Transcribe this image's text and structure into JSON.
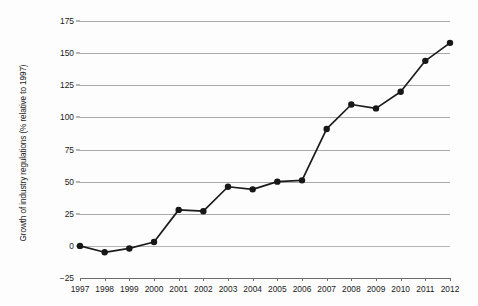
{
  "chart_data": {
    "type": "line",
    "title": "",
    "xlabel": "",
    "ylabel": "Growth of industry regulations (% relative to 1997)",
    "categories": [
      "1997",
      "1998",
      "1999",
      "2000",
      "2001",
      "2002",
      "2003",
      "2004",
      "2005",
      "2006",
      "2007",
      "2008",
      "2009",
      "2010",
      "2011",
      "2012"
    ],
    "values": [
      0,
      -5,
      -2,
      3,
      28,
      27,
      46,
      44,
      50,
      51,
      91,
      110,
      107,
      120,
      144,
      158
    ],
    "series": [
      {
        "name": "Growth of industry regulations",
        "values": [
          0,
          -5,
          -2,
          3,
          28,
          27,
          46,
          44,
          50,
          51,
          91,
          110,
          107,
          120,
          144,
          158
        ]
      }
    ],
    "ylim": [
      -25,
      175
    ],
    "yticks": [
      -25,
      0,
      25,
      50,
      75,
      100,
      125,
      150,
      175
    ],
    "ytick_labels": [
      "−25",
      "0",
      "25",
      "50",
      "75",
      "100",
      "125",
      "150",
      "175"
    ],
    "xlim_categories": [
      "1997",
      "2012"
    ],
    "grid": "horizontal",
    "legend": "none",
    "colors": {
      "line": "#1c1c1c",
      "marker": "#171717",
      "gridline": "#a8a8a8",
      "axis": "#6d6d6d",
      "background": "#fdfdfd",
      "text": "#1a1a1a"
    }
  }
}
